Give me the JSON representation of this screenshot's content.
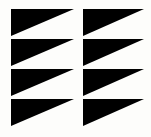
{
  "image": {
    "kind": "logo-mark",
    "description": "Abstract black and white logo mark of four stacked horizontal bands, each split into a left and a right right-triangle pennant wedge pointing right",
    "alt_text": "Logo mark: four stacked rows of paired right-pointing triangular pennants in black on white",
    "width_px": 151,
    "height_px": 137
  },
  "colors": {
    "background": "#fdfdfb",
    "mark": "#000000",
    "separator": "#fdfdfb"
  },
  "geometry": {
    "mark_left_px": 11,
    "mark_right_px": 144,
    "mark_top_px": 9,
    "mark_bottom_px": 128,
    "notch_center_px": 78,
    "notch_width_px": 9,
    "band_count": 4,
    "band_height_px": 29,
    "separator_height_px": 3,
    "band_tops_px": [
      9,
      39,
      69,
      99
    ],
    "wedge_count_per_band": 2,
    "wedge_direction": "right"
  },
  "bands": [
    {
      "index": 1,
      "label": "band-1",
      "left_wedge": {
        "x1": 11,
        "y1": 9,
        "x2": 74,
        "y2": 9,
        "x3": 11,
        "y3": 36
      },
      "right_wedge": {
        "x1": 83,
        "y1": 9,
        "x2": 144,
        "y2": 9,
        "x3": 83,
        "y3": 36
      }
    },
    {
      "index": 2,
      "label": "band-2",
      "left_wedge": {
        "x1": 11,
        "y1": 39,
        "x2": 74,
        "y2": 39,
        "x3": 11,
        "y3": 66
      },
      "right_wedge": {
        "x1": 83,
        "y1": 39,
        "x2": 144,
        "y2": 39,
        "x3": 83,
        "y3": 66
      }
    },
    {
      "index": 3,
      "label": "band-3",
      "left_wedge": {
        "x1": 11,
        "y1": 69,
        "x2": 74,
        "y2": 69,
        "x3": 11,
        "y3": 96
      },
      "right_wedge": {
        "x1": 83,
        "y1": 69,
        "x2": 144,
        "y2": 69,
        "x3": 83,
        "y3": 96
      }
    },
    {
      "index": 4,
      "label": "band-4",
      "left_wedge": {
        "x1": 11,
        "y1": 99,
        "x2": 74,
        "y2": 99,
        "x3": 11,
        "y3": 126
      },
      "right_wedge": {
        "x1": 83,
        "y1": 99,
        "x2": 144,
        "y2": 99,
        "x3": 83,
        "y3": 126
      }
    }
  ]
}
